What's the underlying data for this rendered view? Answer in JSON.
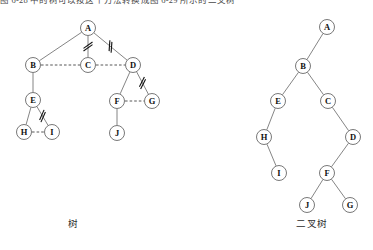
{
  "page": {
    "header_note": "图 6-28 中的树可以按这个方法转换成图 6-29 所示的二叉树"
  },
  "figures": [
    {
      "id": "general-tree",
      "caption": "树",
      "caption_x": 68,
      "caption_y": 216,
      "type": "general-tree",
      "nodes": [
        {
          "label": "A",
          "x": 88,
          "y": 28
        },
        {
          "label": "B",
          "x": 33,
          "y": 65
        },
        {
          "label": "C",
          "x": 88,
          "y": 65
        },
        {
          "label": "D",
          "x": 133,
          "y": 65
        },
        {
          "label": "E",
          "x": 33,
          "y": 100
        },
        {
          "label": "F",
          "x": 117,
          "y": 101
        },
        {
          "label": "G",
          "x": 152,
          "y": 101
        },
        {
          "label": "H",
          "x": 24,
          "y": 132
        },
        {
          "label": "I",
          "x": 52,
          "y": 132
        },
        {
          "label": "J",
          "x": 117,
          "y": 133
        }
      ],
      "solid_edges": [
        {
          "from": "A",
          "to": "B"
        },
        {
          "from": "A",
          "to": "C"
        },
        {
          "from": "A",
          "to": "D"
        },
        {
          "from": "B",
          "to": "E"
        },
        {
          "from": "D",
          "to": "F"
        },
        {
          "from": "D",
          "to": "G"
        },
        {
          "from": "E",
          "to": "H"
        },
        {
          "from": "E",
          "to": "I"
        },
        {
          "from": "F",
          "to": "J"
        }
      ],
      "dashed_edges": [
        {
          "from": "B",
          "to": "C"
        },
        {
          "from": "C",
          "to": "D"
        },
        {
          "from": "F",
          "to": "G"
        },
        {
          "from": "H",
          "to": "I"
        }
      ],
      "cut_marks": [
        {
          "on_edge": "A-C",
          "count": 2
        },
        {
          "on_edge": "A-D",
          "count": 2
        },
        {
          "on_edge": "D-G",
          "count": 2
        },
        {
          "on_edge": "E-I",
          "count": 2
        }
      ]
    },
    {
      "id": "binary-tree",
      "caption": "二叉树",
      "caption_x": 296,
      "caption_y": 216,
      "type": "binary-tree",
      "nodes": [
        {
          "label": "A",
          "x": 327,
          "y": 27
        },
        {
          "label": "B",
          "x": 303,
          "y": 66
        },
        {
          "label": "E",
          "x": 278,
          "y": 101
        },
        {
          "label": "C",
          "x": 328,
          "y": 101
        },
        {
          "label": "H",
          "x": 264,
          "y": 137
        },
        {
          "label": "D",
          "x": 353,
          "y": 137
        },
        {
          "label": "I",
          "x": 279,
          "y": 173
        },
        {
          "label": "F",
          "x": 327,
          "y": 173
        },
        {
          "label": "J",
          "x": 307,
          "y": 205
        },
        {
          "label": "G",
          "x": 350,
          "y": 205
        }
      ],
      "solid_edges": [
        {
          "from": "A",
          "to": "B"
        },
        {
          "from": "B",
          "to": "E"
        },
        {
          "from": "B",
          "to": "C"
        },
        {
          "from": "E",
          "to": "H"
        },
        {
          "from": "C",
          "to": "D"
        },
        {
          "from": "H",
          "to": "I"
        },
        {
          "from": "D",
          "to": "F"
        },
        {
          "from": "F",
          "to": "J"
        },
        {
          "from": "F",
          "to": "G"
        }
      ],
      "dashed_edges": [],
      "cut_marks": []
    }
  ],
  "style": {
    "node_radius": 7.5,
    "node_fill": "#ffffff",
    "node_stroke": "#555555",
    "edge_color": "#666666",
    "dashed_edge_color": "#444444",
    "cut_mark_color": "#111111",
    "text_color": "#111111",
    "background": "#ffffff"
  }
}
